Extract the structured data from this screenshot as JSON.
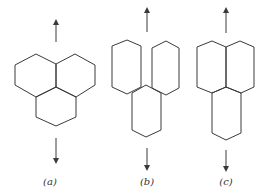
{
  "figure": {
    "panels": [
      {
        "id": "a",
        "label": "(a)",
        "description": "three regular hexagons meeting at a single vertex"
      },
      {
        "id": "b",
        "label": "(b)",
        "description": "three elongated hexagons, top two separated, bottom one offset"
      },
      {
        "id": "c",
        "label": "(c)",
        "description": "three elongated hexagons, top two sharing an edge, bottom one elongated"
      }
    ],
    "arrows": {
      "up": "up-arrow",
      "down": "down-arrow"
    },
    "stroke_color": "#3a3a3a",
    "background": "#ffffff"
  }
}
